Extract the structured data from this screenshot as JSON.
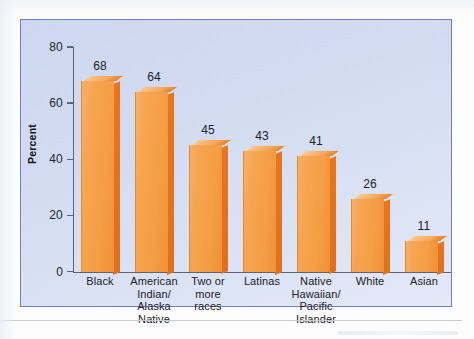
{
  "chart_data": {
    "type": "bar",
    "title": "",
    "subtitle": "",
    "xlabel": "",
    "ylabel": "Percent",
    "ylim": [
      0,
      80
    ],
    "yticks": [
      0,
      20,
      40,
      60,
      80
    ],
    "grid": false,
    "legend": null,
    "orientation": "vertical",
    "style": "3d-bars",
    "categories": [
      "Black",
      "American\nIndian/\nAlaska Native",
      "Two or\nmore\nraces",
      "Latinas",
      "Native\nHawaiian/\nPacific Islander",
      "White",
      "Asian"
    ],
    "values": [
      68,
      64,
      45,
      43,
      41,
      26,
      11
    ],
    "value_labels": [
      "68",
      "64",
      "45",
      "43",
      "41",
      "26",
      "11"
    ]
  },
  "axis": {
    "y_title": "Percent",
    "y_tick_labels": [
      "80",
      "60",
      "40",
      "20",
      "0"
    ]
  },
  "categories_display": [
    {
      "lines": [
        "Black"
      ]
    },
    {
      "lines": [
        "American",
        "Indian/",
        "Alaska Native"
      ]
    },
    {
      "lines": [
        "Two or",
        "more",
        "races"
      ]
    },
    {
      "lines": [
        "Latinas"
      ]
    },
    {
      "lines": [
        "Native",
        "Hawaiian/",
        "Pacific Islander"
      ]
    },
    {
      "lines": [
        "White"
      ]
    },
    {
      "lines": [
        "Asian"
      ]
    }
  ],
  "colors": {
    "bar_front": "#f5a04a",
    "bar_side": "#e2721e",
    "bar_top": "#f6bc7c",
    "panel_background": "#d3dcf1",
    "panel_border": "#6d82b8",
    "axis": "#5c6472",
    "text": "#1d2128",
    "page_background": "#ffffff"
  }
}
